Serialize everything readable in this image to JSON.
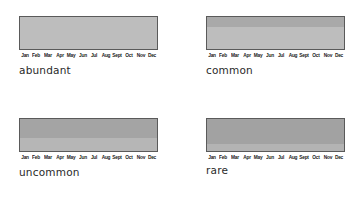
{
  "chart_data": {
    "type": "heatmap",
    "title": "",
    "months": [
      "Jan",
      "Feb",
      "Mar",
      "Apr",
      "May",
      "Jun",
      "Jul",
      "Aug",
      "Sept",
      "Oct",
      "Nov",
      "Dec"
    ],
    "panels": [
      {
        "label": "abundant",
        "bands": [
          {
            "fraction": 1.0,
            "color": "#bdbdbd"
          }
        ]
      },
      {
        "label": "common",
        "bands": [
          {
            "fraction": 0.31,
            "color": "#a9a9a9"
          },
          {
            "fraction": 0.69,
            "color": "#bdbdbd"
          }
        ]
      },
      {
        "label": "uncommon",
        "bands": [
          {
            "fraction": 0.58,
            "color": "#a4a4a4"
          },
          {
            "fraction": 0.42,
            "color": "#b6b6b6"
          }
        ]
      },
      {
        "label": "rare",
        "bands": [
          {
            "fraction": 0.79,
            "color": "#a2a2a2"
          },
          {
            "fraction": 0.21,
            "color": "#b3b3b3"
          }
        ]
      }
    ],
    "legend": [],
    "grid": false
  },
  "colors": {
    "border": "#5a5a5a",
    "text": "#2a2a2a"
  }
}
